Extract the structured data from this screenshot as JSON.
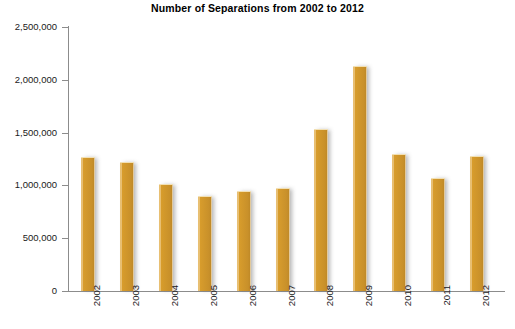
{
  "chart_data": {
    "type": "bar",
    "title": "Number of Separations from 2002 to 2012",
    "xlabel": "",
    "ylabel": "",
    "categories": [
      "2002",
      "2003",
      "2004",
      "2005",
      "2006",
      "2007",
      "2008",
      "2009",
      "2010",
      "2011",
      "2012"
    ],
    "values": [
      1260000,
      1210000,
      1000000,
      890000,
      940000,
      970000,
      1525000,
      2120000,
      1290000,
      1060000,
      1265000
    ],
    "ylim": [
      0,
      2500000
    ],
    "ytick_values": [
      0,
      500000,
      1000000,
      1500000,
      2000000,
      2500000
    ],
    "ytick_labels": [
      "0",
      "500,000",
      "1,000,000",
      "1,500,000",
      "2,000,000",
      "2,500,000"
    ],
    "grid": false,
    "legend": null,
    "bar_color": "#c8902a",
    "axis_color": "#8c8c8c",
    "title_color": "#000000",
    "label_color": "#1a1a1a"
  }
}
